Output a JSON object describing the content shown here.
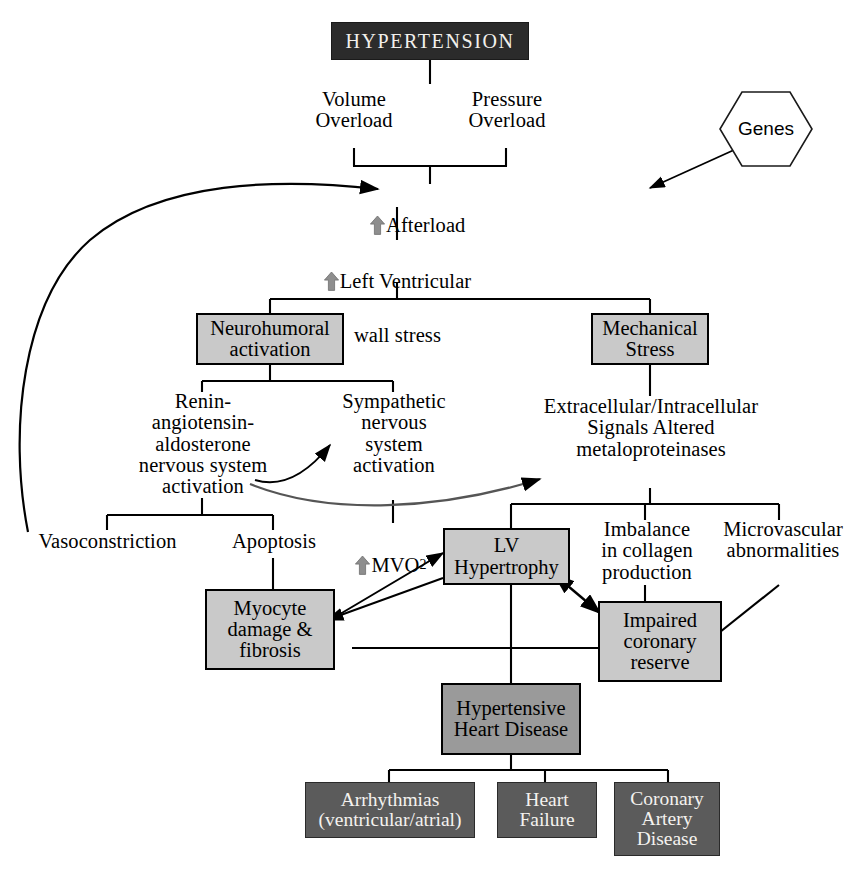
{
  "title_banner": {
    "text": "HYPERTENSION"
  },
  "nodes": {
    "volume_overload": "Volume\nOverload",
    "pressure_overload": "Pressure\nOverload",
    "genes": "Genes",
    "afterload": "Afterload",
    "lv_wall_stress_line1": "Left Ventricular",
    "lv_wall_stress_line2": "wall stress",
    "neurohumoral": "Neurohumoral\nactivation",
    "mechanical_stress": "Mechanical\nStress",
    "renin": "Renin-\nangiotensin-\naldosterone\nnervous system\nactivation",
    "sympathetic": "Sympathetic\nnervous\nsystem\nactivation",
    "extracellular": "Extracellular/Intracellular\nSignals Altered\nmetaloproteinases",
    "vasoconstriction": "Vasoconstriction",
    "apoptosis": "Apoptosis",
    "mvo2_label": "MVO",
    "mvo2_sub": "2",
    "lv_hypertrophy": "LV\nHypertrophy",
    "imbalance_collagen": "Imbalance\nin collagen\nproduction",
    "microvascular": "Microvascular\nabnormalities",
    "myocyte": "Myocyte\ndamage &\nfibrosis",
    "impaired_coronary": "Impaired\ncoronary\nreserve",
    "hypertensive_heart_disease": "Hypertensive\nHeart Disease",
    "arrhythmias": "Arrhythmias\n(ventricular/atrial)",
    "heart_failure": "Heart\nFailure",
    "coronary_artery_disease": "Coronary\nArtery\nDisease"
  },
  "colors": {
    "banner_fill": "#2b2b2b",
    "banner_text": "#f2f0ec",
    "box_light_fill": "#c9c9c9",
    "box_mid_fill": "#9a9a9a",
    "box_dark_fill": "#5b5b5b",
    "box_dark_text": "#f4f2ef",
    "stroke": "#000000",
    "uparrow_fill": "#8e8e8e",
    "page_bg": "#ffffff"
  },
  "caption": {
    "text": ""
  },
  "icons": {
    "increase_arrow": "up-arrow-icon",
    "genes_shape": "hexagon-icon"
  }
}
